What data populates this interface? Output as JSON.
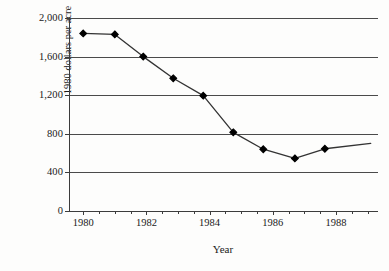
{
  "chart_data": {
    "type": "line",
    "title": "",
    "xlabel": "Year",
    "ylabel": "1980 dollars per acre",
    "xlim": [
      1979.55,
      1989.3
    ],
    "ylim": [
      0,
      2000
    ],
    "grid": "horizontal",
    "legend": "none",
    "marker": "filled-diamond",
    "line_color": "#333333",
    "marker_color": "#000000",
    "x_ticks": [
      {
        "value": 1980,
        "label": "1980"
      },
      {
        "value": 1982,
        "label": "1982"
      },
      {
        "value": 1984,
        "label": "1984"
      },
      {
        "value": 1986,
        "label": "1986"
      },
      {
        "value": 1988,
        "label": "1988"
      }
    ],
    "x_minor_ticks": [
      1980.5,
      1981,
      1981.5,
      1982.5,
      1983,
      1983.5,
      1984.5,
      1985,
      1985.5,
      1986.5,
      1987,
      1987.5,
      1988.5,
      1989
    ],
    "y_ticks": [
      {
        "value": 2000,
        "label": "2,000"
      },
      {
        "value": 1600,
        "label": "1,600"
      },
      {
        "value": 1200,
        "label": "1,200"
      },
      {
        "value": 800,
        "label": "800"
      },
      {
        "value": 400,
        "label": "400"
      },
      {
        "value": 0,
        "label": "0"
      }
    ],
    "series": [
      {
        "name": "1980 dollars per acre",
        "points": [
          {
            "x": 1980.0,
            "y": 1840
          },
          {
            "x": 1981.0,
            "y": 1830
          },
          {
            "x": 1981.9,
            "y": 1600
          },
          {
            "x": 1982.85,
            "y": 1375
          },
          {
            "x": 1983.8,
            "y": 1195
          },
          {
            "x": 1984.75,
            "y": 815
          },
          {
            "x": 1985.7,
            "y": 640
          },
          {
            "x": 1986.7,
            "y": 545
          },
          {
            "x": 1987.65,
            "y": 645
          },
          {
            "x": 1989.1,
            "y": 700
          }
        ]
      }
    ]
  }
}
